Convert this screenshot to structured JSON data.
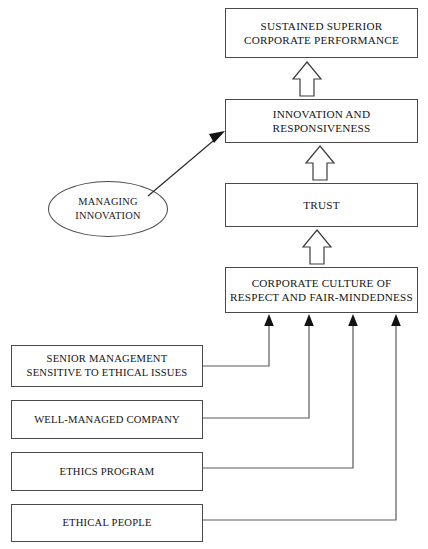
{
  "diagram": {
    "background_color": "#ffffff",
    "box_border_color": "#4a4a4a",
    "arrow_color": "#3d3d3d",
    "nodes": {
      "sustained": {
        "label": "SUSTAINED SUPERIOR\nCORPORATE PERFORMANCE",
        "shape": "rectangle"
      },
      "innovation": {
        "label": "INNOVATION  AND\nRESPONSIVENESS",
        "shape": "rectangle"
      },
      "trust": {
        "label": "TRUST",
        "shape": "rectangle"
      },
      "culture": {
        "label": "CORPORATE CULTURE OF\nRESPECT AND FAIR-MINDEDNESS",
        "shape": "rectangle"
      },
      "managing": {
        "label": "MANAGING\nINNOVATION",
        "shape": "ellipse"
      },
      "senior": {
        "label": "SENIOR MANAGEMENT\nSENSITIVE TO ETHICAL ISSUES",
        "shape": "rectangle"
      },
      "wellmanaged": {
        "label": "WELL-MANAGED COMPANY",
        "shape": "rectangle"
      },
      "ethicsprogram": {
        "label": "ETHICS PROGRAM",
        "shape": "rectangle"
      },
      "ethicalpeople": {
        "label": "ETHICAL PEOPLE",
        "shape": "rectangle"
      }
    },
    "connectors": [
      {
        "from": "innovation",
        "to": "sustained",
        "style": "block-arrow-up"
      },
      {
        "from": "trust",
        "to": "innovation",
        "style": "block-arrow-up"
      },
      {
        "from": "culture",
        "to": "trust",
        "style": "block-arrow-up"
      },
      {
        "from": "managing",
        "to": "innovation",
        "style": "diagonal-arrow"
      },
      {
        "from": "senior",
        "to": "culture",
        "style": "elbow-arrow-up"
      },
      {
        "from": "wellmanaged",
        "to": "culture",
        "style": "elbow-arrow-up"
      },
      {
        "from": "ethicsprogram",
        "to": "culture",
        "style": "elbow-arrow-up"
      },
      {
        "from": "ethicalpeople",
        "to": "culture",
        "style": "elbow-arrow-up"
      }
    ]
  }
}
